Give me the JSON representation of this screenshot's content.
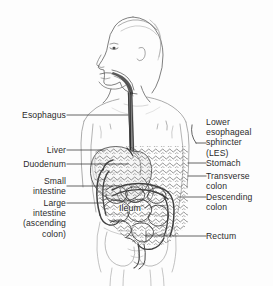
{
  "figure": {
    "background_color": "#fdfdfd",
    "line_color": "#3a3a3a",
    "text_color": "#2b2b2b"
  },
  "labels": {
    "left": [
      {
        "id": "esophagus",
        "text": "Esophagus"
      },
      {
        "id": "liver",
        "text": "Liver"
      },
      {
        "id": "duodenum",
        "text": "Duodenum"
      },
      {
        "id": "small-intestine",
        "text": "Small\nintestine"
      },
      {
        "id": "large-intestine",
        "text": "Large\nintestine\n(ascending\ncolon)"
      }
    ],
    "right": [
      {
        "id": "les",
        "text": "Lower\nesophageal\nsphincter\n(LES)"
      },
      {
        "id": "stomach",
        "text": "Stomach"
      },
      {
        "id": "transverse-colon",
        "text": "Transverse\ncolon"
      },
      {
        "id": "descending-colon",
        "text": "Descending\ncolon"
      },
      {
        "id": "rectum",
        "text": "Rectum"
      }
    ],
    "overlay": [
      {
        "id": "ileum",
        "text": "Ileum"
      }
    ]
  }
}
